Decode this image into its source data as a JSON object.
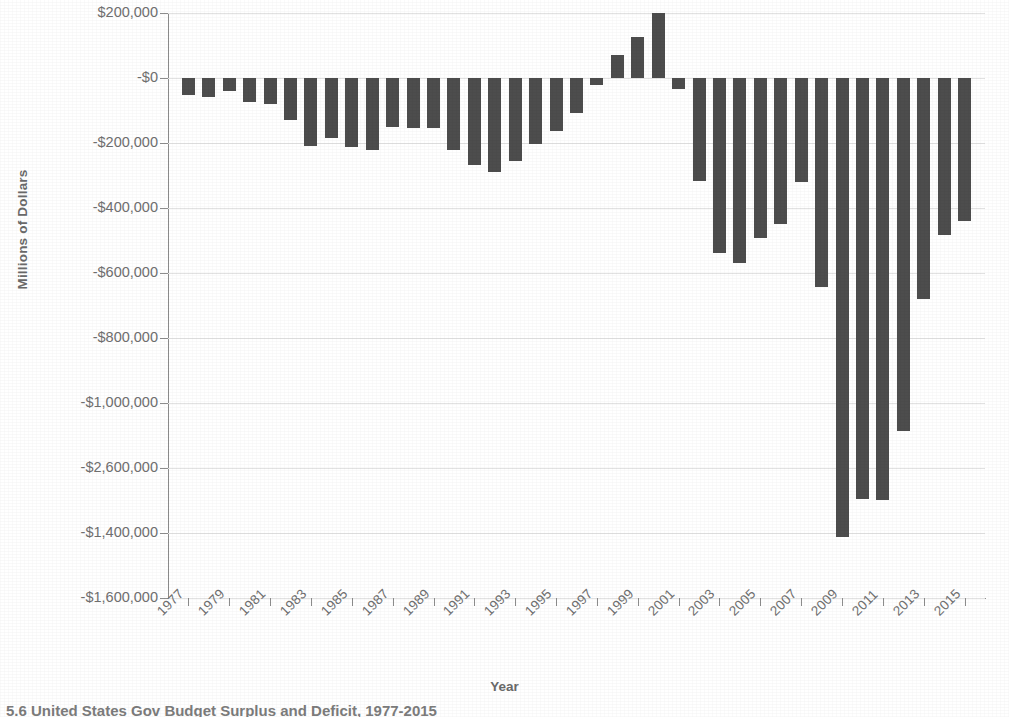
{
  "chart_data": {
    "type": "bar",
    "title": "",
    "xlabel": "Year",
    "ylabel": "Millions of Dollars",
    "grid": true,
    "legend": "none",
    "note": "Y axis tick labels are printed non-monotonically in the source image: -$2,600,000 appears between -$1,000,000 and -$1,400,000.",
    "ytick_labels": [
      "$200,000",
      "-$0",
      "-$200,000",
      "-$400,000",
      "-$600,000",
      "-$800,000",
      "-$1,000,000",
      "-$2,600,000",
      "-$1,400,000",
      "-$1,600,000"
    ],
    "ytick_values": [
      200000,
      0,
      -200000,
      -400000,
      -600000,
      -800000,
      -1000000,
      -1200000,
      -1400000,
      -1600000
    ],
    "ylim": [
      -1600000,
      200000
    ],
    "xtick_labels": [
      "1977",
      "1979",
      "1981",
      "1983",
      "1985",
      "1987",
      "1989",
      "1991",
      "1993",
      "1995",
      "1997",
      "1999",
      "2001",
      "2003",
      "2005",
      "2007",
      "2009",
      "2011",
      "2013",
      "2015"
    ],
    "categories": [
      "1977",
      "1978",
      "1979",
      "1980",
      "1981",
      "1982",
      "1983",
      "1984",
      "1985",
      "1986",
      "1987",
      "1988",
      "1989",
      "1990",
      "1991",
      "1992",
      "1993",
      "1994",
      "1995",
      "1996",
      "1997",
      "1998",
      "1999",
      "2000",
      "2001",
      "2002",
      "2003",
      "2004",
      "2005",
      "2006",
      "2007",
      "2008",
      "2009",
      "2010",
      "2011",
      "2012",
      "2013",
      "2014",
      "2015"
    ],
    "values": [
      -53700,
      -59200,
      -40700,
      -73800,
      -79000,
      -128000,
      -207800,
      -185400,
      -212300,
      -221200,
      -149700,
      -155200,
      -152600,
      -221000,
      -269200,
      -290300,
      -255100,
      -203200,
      -164000,
      -107400,
      -21900,
      69300,
      125600,
      236200,
      -32400,
      -317400,
      -538400,
      -568000,
      -493600,
      -448500,
      -320000,
      -641800,
      -1412700,
      -1294400,
      -1299600,
      -1087000,
      -679500,
      -484600,
      -438900
    ],
    "series_name": "Federal Surplus or Deficit",
    "bar_color": "#4d4d4d"
  },
  "axes": {
    "y_title": "Millions of Dollars",
    "x_title": "Year"
  },
  "caption": {
    "text": "5.6 United States Gov Budget Surplus and Deficit, 1977-2015"
  }
}
